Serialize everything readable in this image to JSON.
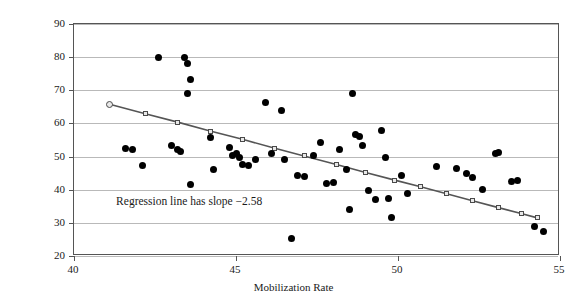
{
  "chart_data": {
    "type": "scatter",
    "title": "",
    "xlabel": "Mobilization Rate",
    "ylabel": "% Change in Weekly Wage, 1939–49",
    "xlim": [
      40,
      55
    ],
    "ylim": [
      20,
      90
    ],
    "xticks": [
      40,
      45,
      50,
      55
    ],
    "yticks": [
      20,
      30,
      40,
      50,
      60,
      70,
      80,
      90
    ],
    "grid": true,
    "legend": "none",
    "annotations": [
      {
        "text": "Regression line has slope −2.58",
        "x": 41.3,
        "y": 36.5
      }
    ],
    "series": [
      {
        "name": "states",
        "type": "scatter",
        "marker": "filled-circle",
        "color": "#000000",
        "points": [
          [
            41.6,
            52.4
          ],
          [
            41.8,
            52.1
          ],
          [
            42.1,
            47.3
          ],
          [
            42.6,
            80.0
          ],
          [
            43.0,
            53.4
          ],
          [
            43.2,
            52.0
          ],
          [
            43.3,
            51.6
          ],
          [
            43.4,
            79.8
          ],
          [
            43.5,
            78.0
          ],
          [
            43.6,
            73.2
          ],
          [
            43.5,
            68.9
          ],
          [
            43.6,
            41.6
          ],
          [
            44.2,
            55.9
          ],
          [
            44.3,
            46.0
          ],
          [
            44.8,
            52.6
          ],
          [
            44.9,
            50.2
          ],
          [
            45.0,
            51.0
          ],
          [
            45.1,
            49.6
          ],
          [
            45.2,
            47.5
          ],
          [
            45.4,
            47.3
          ],
          [
            45.6,
            49.2
          ],
          [
            45.9,
            66.4
          ],
          [
            46.1,
            51.0
          ],
          [
            46.4,
            63.8
          ],
          [
            46.5,
            49.2
          ],
          [
            46.7,
            25.2
          ],
          [
            46.9,
            44.2
          ],
          [
            47.1,
            44.0
          ],
          [
            47.4,
            50.4
          ],
          [
            47.6,
            54.1
          ],
          [
            47.8,
            41.9
          ],
          [
            48.0,
            42.2
          ],
          [
            48.2,
            52.0
          ],
          [
            48.4,
            46.2
          ],
          [
            48.5,
            34.0
          ],
          [
            48.6,
            69.1
          ],
          [
            48.7,
            56.6
          ],
          [
            48.8,
            56.0
          ],
          [
            48.9,
            53.2
          ],
          [
            49.1,
            39.8
          ],
          [
            49.3,
            37.0
          ],
          [
            49.5,
            58.0
          ],
          [
            49.6,
            49.8
          ],
          [
            49.7,
            37.2
          ],
          [
            49.8,
            31.6
          ],
          [
            50.1,
            44.4
          ],
          [
            50.3,
            39.0
          ],
          [
            51.2,
            47.0
          ],
          [
            51.8,
            46.4
          ],
          [
            52.1,
            45.0
          ],
          [
            52.3,
            43.6
          ],
          [
            52.6,
            40.0
          ],
          [
            53.0,
            51.0
          ],
          [
            53.1,
            51.2
          ],
          [
            53.5,
            42.6
          ],
          [
            53.7,
            42.8
          ],
          [
            54.2,
            28.8
          ],
          [
            54.5,
            27.4
          ]
        ]
      },
      {
        "name": "regression-line",
        "type": "line",
        "marker": "open-square",
        "color": "#555555",
        "slope": -2.58,
        "points": [
          [
            41.1,
            65.8
          ],
          [
            42.2,
            62.9
          ],
          [
            43.2,
            60.4
          ],
          [
            44.2,
            57.7
          ],
          [
            45.2,
            55.2
          ],
          [
            46.2,
            52.5
          ],
          [
            47.1,
            50.2
          ],
          [
            48.1,
            47.6
          ],
          [
            49.0,
            45.2
          ],
          [
            49.9,
            42.9
          ],
          [
            50.7,
            40.9
          ],
          [
            51.5,
            38.8
          ],
          [
            52.3,
            36.7
          ],
          [
            53.1,
            34.6
          ],
          [
            53.8,
            32.8
          ],
          [
            54.3,
            31.5
          ]
        ]
      }
    ]
  },
  "axes": {
    "x_title": "Mobilization Rate",
    "y_title": "% Change in Weekly Wage, 1939–49",
    "x_tick_labels": [
      "40",
      "45",
      "50",
      "55"
    ],
    "y_tick_labels": [
      "20",
      "30",
      "40",
      "50",
      "60",
      "70",
      "80",
      "90"
    ]
  },
  "annotation": {
    "text": "Regression line has slope −2.58"
  },
  "colors": {
    "point": "#000000",
    "line": "#555555",
    "grid": "#b9b9b9",
    "axis": "#555555",
    "background": "#ffffff"
  }
}
